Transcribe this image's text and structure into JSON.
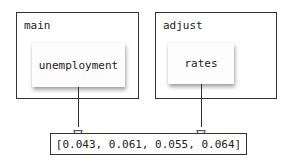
{
  "diagram": {
    "frames": [
      {
        "name": "main",
        "label": "main",
        "variable": "unemployment"
      },
      {
        "name": "adjust",
        "label": "adjust",
        "variable": "rates"
      }
    ],
    "shared_value": {
      "display": "[0.043, 0.061, 0.055, 0.064]",
      "values": [
        0.043,
        0.061,
        0.055,
        0.064
      ]
    },
    "edges": [
      {
        "from": "unemployment",
        "to": "shared_value"
      },
      {
        "from": "rates",
        "to": "shared_value"
      }
    ]
  },
  "colors": {
    "border": "#333333",
    "text": "#222222",
    "background": "#ffffff"
  }
}
